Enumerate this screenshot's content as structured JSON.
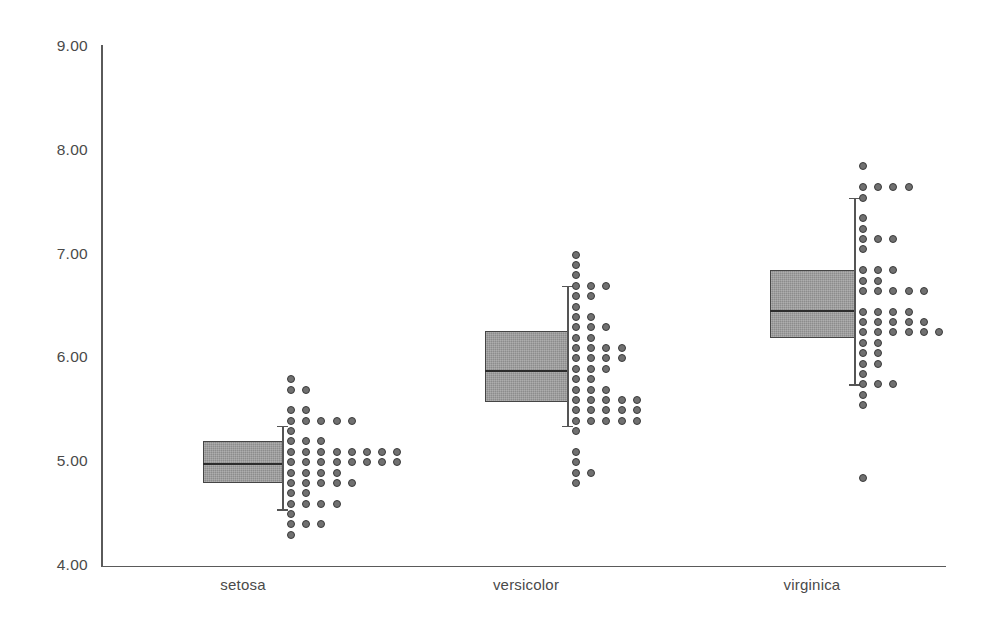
{
  "chart_data": {
    "type": "boxplot-dotplot",
    "title": "",
    "subtitle": "",
    "xlabel": "",
    "ylabel": "",
    "categories": [
      "setosa",
      "versicolor",
      "virginica"
    ],
    "yticks": [
      "4.00",
      "5.00",
      "6.00",
      "7.00",
      "8.00",
      "9.00"
    ],
    "ytick_values": [
      4.0,
      5.0,
      6.0,
      7.0,
      8.0,
      9.0
    ],
    "ylim": [
      4.0,
      9.0
    ],
    "grid": false,
    "legend": null,
    "colors": {
      "box_fill": "#8c8c8c",
      "box_edge": "#454545",
      "median_line": "#2c2c2c",
      "whisker": "#555555",
      "dot_fill": "#707070",
      "dot_edge": "#3a3a3a",
      "axis": "#5a5a5a",
      "tick_text": "#4a4a4a",
      "background": "#ffffff"
    },
    "series": [
      {
        "name": "setosa",
        "box": {
          "q1": 4.8,
          "median": 4.98,
          "q3": 5.2,
          "whisker_low": 4.55,
          "whisker_high": 5.35
        },
        "outliers": [],
        "dot_stacks": [
          {
            "value": 5.8,
            "count": 1
          },
          {
            "value": 5.7,
            "count": 2
          },
          {
            "value": 5.5,
            "count": 2
          },
          {
            "value": 5.4,
            "count": 5
          },
          {
            "value": 5.3,
            "count": 1
          },
          {
            "value": 5.2,
            "count": 3
          },
          {
            "value": 5.1,
            "count": 8
          },
          {
            "value": 5.0,
            "count": 8
          },
          {
            "value": 4.9,
            "count": 4
          },
          {
            "value": 4.8,
            "count": 5
          },
          {
            "value": 4.7,
            "count": 2
          },
          {
            "value": 4.6,
            "count": 4
          },
          {
            "value": 4.5,
            "count": 1
          },
          {
            "value": 4.4,
            "count": 3
          },
          {
            "value": 4.3,
            "count": 1
          }
        ]
      },
      {
        "name": "versicolor",
        "box": {
          "q1": 5.58,
          "median": 5.88,
          "q3": 6.26,
          "whisker_low": 5.35,
          "whisker_high": 6.7
        },
        "outliers": [],
        "dot_stacks": [
          {
            "value": 7.0,
            "count": 1
          },
          {
            "value": 6.9,
            "count": 1
          },
          {
            "value": 6.8,
            "count": 1
          },
          {
            "value": 6.7,
            "count": 3
          },
          {
            "value": 6.6,
            "count": 2
          },
          {
            "value": 6.5,
            "count": 1
          },
          {
            "value": 6.4,
            "count": 2
          },
          {
            "value": 6.3,
            "count": 3
          },
          {
            "value": 6.2,
            "count": 2
          },
          {
            "value": 6.1,
            "count": 4
          },
          {
            "value": 6.0,
            "count": 4
          },
          {
            "value": 5.9,
            "count": 3
          },
          {
            "value": 5.8,
            "count": 2
          },
          {
            "value": 5.7,
            "count": 3
          },
          {
            "value": 5.6,
            "count": 5
          },
          {
            "value": 5.5,
            "count": 5
          },
          {
            "value": 5.4,
            "count": 5
          },
          {
            "value": 5.3,
            "count": 1
          },
          {
            "value": 5.1,
            "count": 1
          },
          {
            "value": 5.0,
            "count": 1
          },
          {
            "value": 4.9,
            "count": 2
          },
          {
            "value": 4.8,
            "count": 1
          }
        ]
      },
      {
        "name": "virginica",
        "box": {
          "q1": 6.2,
          "median": 6.46,
          "q3": 6.85,
          "whisker_low": 5.75,
          "whisker_high": 7.55
        },
        "outliers": [
          4.85
        ],
        "dot_stacks": [
          {
            "value": 7.85,
            "count": 1
          },
          {
            "value": 7.65,
            "count": 4
          },
          {
            "value": 7.55,
            "count": 1
          },
          {
            "value": 7.35,
            "count": 1
          },
          {
            "value": 7.25,
            "count": 1
          },
          {
            "value": 7.15,
            "count": 3
          },
          {
            "value": 7.05,
            "count": 1
          },
          {
            "value": 6.85,
            "count": 3
          },
          {
            "value": 6.75,
            "count": 2
          },
          {
            "value": 6.65,
            "count": 5
          },
          {
            "value": 6.45,
            "count": 4
          },
          {
            "value": 6.35,
            "count": 5
          },
          {
            "value": 6.25,
            "count": 6
          },
          {
            "value": 6.15,
            "count": 2
          },
          {
            "value": 6.05,
            "count": 2
          },
          {
            "value": 5.95,
            "count": 2
          },
          {
            "value": 5.85,
            "count": 1
          },
          {
            "value": 5.75,
            "count": 3
          },
          {
            "value": 5.65,
            "count": 1
          },
          {
            "value": 5.55,
            "count": 1
          }
        ]
      }
    ]
  },
  "axis_labels": {
    "y": [
      "9.00",
      "8.00",
      "7.00",
      "6.00",
      "5.00",
      "4.00"
    ],
    "x": [
      "setosa",
      "versicolor",
      "virginica"
    ]
  }
}
